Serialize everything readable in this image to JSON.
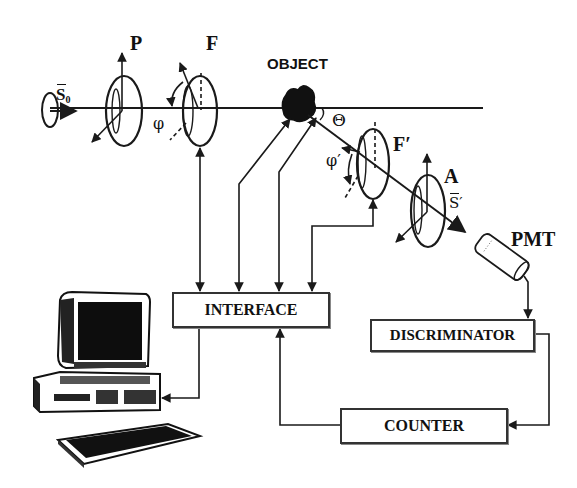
{
  "diagram": {
    "type": "optical-setup-block-diagram",
    "labels": {
      "source_vector": "S",
      "source_subscript": "0",
      "polarizer": "P",
      "filter": "F",
      "phi": "φ",
      "object": "OBJECT",
      "theta": "Θ",
      "filter2": "F′",
      "phi2": "φ′",
      "analyzer": "A",
      "scattered_vector": "S′",
      "pmt": "PMT"
    },
    "blocks": {
      "interface": "INTERFACE",
      "discriminator": "DISCRIMINATOR",
      "counter": "COUNTER"
    },
    "colors": {
      "line": "#1a1a1a",
      "box_border": "#333333",
      "background": "#ffffff"
    }
  }
}
